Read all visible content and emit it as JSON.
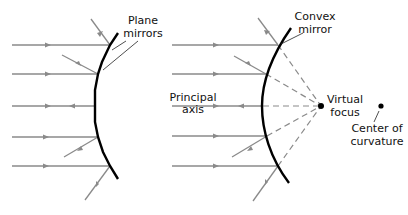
{
  "diagram": {
    "left": {
      "title": "Plane mirrors approximating a convex surface",
      "label_line1": "Plane",
      "label_line2": "mirrors"
    },
    "right": {
      "mirror_label_line1": "Convex",
      "mirror_label_line2": "mirror",
      "axis_label_line1": "Principal",
      "axis_label_line2": "axis",
      "focus_label_line1": "Virtual",
      "focus_label_line2": "focus",
      "center_label_line1": "Center of",
      "center_label_line2": "curvature"
    },
    "colors": {
      "mirror": "#000000",
      "ray": "#8a8a8a",
      "text": "#111111",
      "background": "#ffffff"
    }
  }
}
